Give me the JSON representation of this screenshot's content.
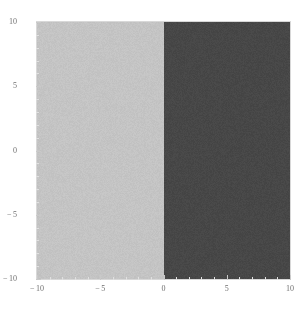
{
  "chart_data": {
    "type": "heatmap",
    "title": "",
    "subtitle": "",
    "xlabel": "",
    "ylabel": "",
    "xlim": [
      -10,
      10
    ],
    "ylim": [
      -10,
      10
    ],
    "grid": false,
    "legend": false,
    "frame": true,
    "xticks": [
      {
        "value": -10,
        "label": "-10"
      },
      {
        "value": -5,
        "label": "-5"
      },
      {
        "value": 0,
        "label": "0"
      },
      {
        "value": 5,
        "label": "5"
      },
      {
        "value": 10,
        "label": "10"
      }
    ],
    "yticks": [
      {
        "value": -10,
        "label": "-10"
      },
      {
        "value": -5,
        "label": "-5"
      },
      {
        "value": 0,
        "label": "0"
      },
      {
        "value": 5,
        "label": "5"
      },
      {
        "value": 10,
        "label": "10"
      }
    ],
    "x_minor_ticks": [
      -9,
      -8,
      -7,
      -6,
      -4,
      -3,
      -2,
      -1,
      1,
      2,
      3,
      4,
      6,
      7,
      8,
      9
    ],
    "y_minor_ticks": [
      -9,
      -8,
      -7,
      -6,
      -4,
      -3,
      -2,
      -1,
      1,
      2,
      3,
      4,
      6,
      7,
      8,
      9
    ],
    "regions": [
      {
        "name": "left-region",
        "condition": "x < 0",
        "x_range": [
          -10,
          0
        ],
        "y_range": [
          -10,
          10
        ],
        "value": 0,
        "color": "#c4c4c4"
      },
      {
        "name": "right-region",
        "condition": "x > 0",
        "x_range": [
          0,
          10
        ],
        "y_range": [
          -10,
          10
        ],
        "value": 1,
        "color": "#474747"
      }
    ],
    "boundary": {
      "type": "vertical-line",
      "x": 0
    },
    "colors": {
      "light_fill": "#c4c4c4",
      "dark_fill": "#474747",
      "frame": "#d8d8d8",
      "tick": "#c9c9c9",
      "tick_minor": "#e0e0e0",
      "label": "#6f6f6f",
      "background": "#ffffff"
    }
  }
}
